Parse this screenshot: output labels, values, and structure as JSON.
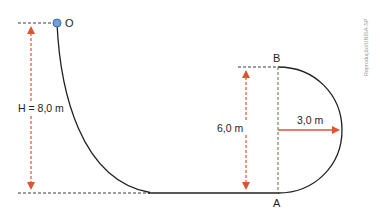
{
  "diagram": {
    "type": "physics-track",
    "labels": {
      "start_point": "O",
      "point_a": "A",
      "point_b": "B",
      "height_h": "H = 8,0 m",
      "height_loop": "6,0 m",
      "radius": "3,0 m"
    },
    "credit": "Reprodução/UNISA-SP",
    "colors": {
      "track": "#231f20",
      "dimension_arrow": "#e0532f",
      "guide_dashed": "#3a3a3a",
      "loop_dashed": "#4a7a3a",
      "ball_fill": "#6fa0d8",
      "ball_stroke": "#3d6fae"
    },
    "values": {
      "H_m": 8.0,
      "loop_top_height_m": 6.0,
      "radius_m": 3.0
    }
  }
}
